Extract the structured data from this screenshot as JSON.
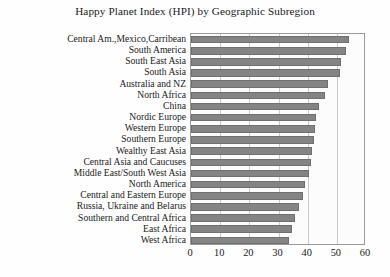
{
  "chart_data": {
    "type": "bar",
    "orientation": "horizontal",
    "title": "Happy Planet Index (HPI) by Geographic Subregion",
    "xlabel": "",
    "ylabel": "",
    "xlim": [
      0,
      60
    ],
    "xticks": [
      0,
      10,
      20,
      30,
      40,
      50,
      60
    ],
    "grid": true,
    "legend": false,
    "bar_color": "#848484",
    "categories": [
      "Central Am.,Mexico,Carribean",
      "South America",
      "South East Asia",
      "South Asia",
      "Australia and NZ",
      "North Africa",
      "China",
      "Nordic Europe",
      "Western Europe",
      "Southern Europe",
      "Wealthy East Asia",
      "Central Asia and Caucuses",
      "Middle East/South West Asia",
      "North America",
      "Central and Eastern Europe",
      "Russia, Ukraine and Belarus",
      "Southern and Central Africa",
      "East Africa",
      "West Africa"
    ],
    "values": [
      54.0,
      53.0,
      51.5,
      51.0,
      47.0,
      46.0,
      44.0,
      43.0,
      42.5,
      42.0,
      41.5,
      41.0,
      40.5,
      39.0,
      38.5,
      37.0,
      35.5,
      34.5,
      33.5
    ]
  },
  "axis": {
    "tick_labels": [
      "0",
      "10",
      "20",
      "30",
      "40",
      "50",
      "60"
    ]
  }
}
